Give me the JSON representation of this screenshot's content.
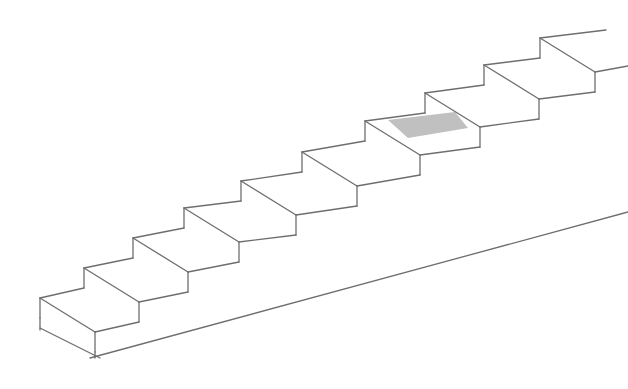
{
  "diagram": {
    "title": "",
    "type": "staircase-line-drawing",
    "step_count": 10,
    "highlighted_step_index": 6,
    "colors": {
      "line": "#6e6e6e",
      "highlight": "#bdbdbd",
      "background": "#ffffff"
    },
    "riser_height": 20,
    "nosing_offset": [
      55,
      34
    ],
    "step_corners": [
      [
        40,
        298
      ],
      [
        84,
        268
      ],
      [
        133,
        238
      ],
      [
        184,
        208
      ],
      [
        241,
        181
      ],
      [
        302,
        152
      ],
      [
        365,
        121
      ],
      [
        425,
        93
      ],
      [
        484,
        65
      ],
      [
        540,
        38
      ]
    ],
    "base_line": {
      "from": [
        90,
        358
      ],
      "to": [
        628,
        212
      ]
    },
    "top_lines": [
      {
        "from": [
          540,
          38
        ],
        "to": [
          606,
          30
        ]
      },
      {
        "from": [
          595,
          72
        ],
        "to": [
          628,
          66
        ]
      }
    ],
    "highlight_region": [
      [
        388,
        120
      ],
      [
        455,
        112
      ],
      [
        468,
        128
      ],
      [
        408,
        138
      ]
    ]
  }
}
